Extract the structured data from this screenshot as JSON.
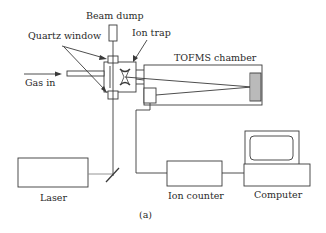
{
  "diagram": {
    "labels": {
      "beam_dump": "Beam dump",
      "quartz_window": "Quartz window",
      "ion_trap": "Ion trap",
      "tofms_chamber": "TOFMS chamber",
      "gas_in": "Gas in",
      "laser": "Laser",
      "ion_counter": "Ion counter",
      "computer": "Computer",
      "caption": "(a)"
    },
    "colors": {
      "stroke": "#3a3a3a",
      "background": "#ffffff"
    }
  }
}
